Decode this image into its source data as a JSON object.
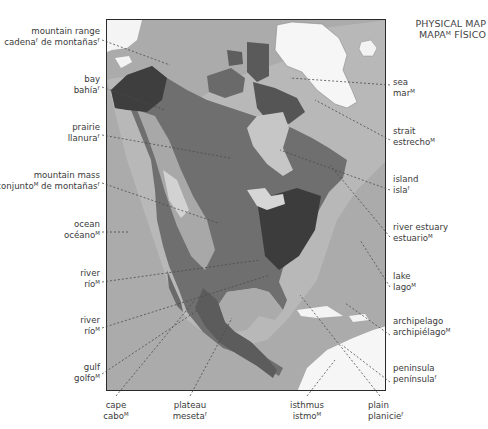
{
  "title": {
    "line1": "PHYSICAL MAP",
    "line2": "MAPAᴹ FÍSICO"
  },
  "map": {
    "region": "North America",
    "style": "grayscale relief"
  },
  "labels": {
    "left": [
      {
        "en": "mountain range",
        "es": "cadenaᶠ de montañasᶠ"
      },
      {
        "en": "bay",
        "es": "bahíaᶠ"
      },
      {
        "en": "prairie",
        "es": "llanuraᶠ"
      },
      {
        "en": "mountain mass",
        "es": "conjuntoᴹ de montañasᶠ"
      },
      {
        "en": "ocean",
        "es": "océanoᴹ"
      },
      {
        "en": "river",
        "es": "ríoᴹ"
      },
      {
        "en": "river",
        "es": "ríoᴹ"
      },
      {
        "en": "gulf",
        "es": "golfoᴹ"
      }
    ],
    "right": [
      {
        "en": "sea",
        "es": "marᴹ"
      },
      {
        "en": "strait",
        "es": "estrechoᴹ"
      },
      {
        "en": "island",
        "es": "islaᶠ"
      },
      {
        "en": "river estuary",
        "es": "estuarioᴹ"
      },
      {
        "en": "lake",
        "es": "lagoᴹ"
      },
      {
        "en": "archipelago",
        "es": "archipiélagoᴹ"
      },
      {
        "en": "peninsula",
        "es": "penínsulaᶠ"
      }
    ],
    "bottom": [
      {
        "en": "cape",
        "es": "caboᴹ"
      },
      {
        "en": "plateau",
        "es": "mesetaᶠ"
      },
      {
        "en": "isthmus",
        "es": "istmoᴹ"
      },
      {
        "en": "plain",
        "es": "planicieᶠ"
      }
    ]
  }
}
